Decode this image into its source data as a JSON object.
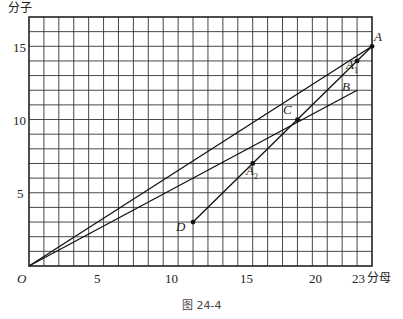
{
  "axes": {
    "y_label": "分子",
    "x_label": "分母",
    "origin": "O",
    "x_ticks": [
      "5",
      "10",
      "15",
      "20",
      "23"
    ],
    "y_ticks": [
      "5",
      "10",
      "15"
    ]
  },
  "points": {
    "A": "A",
    "A1": "A",
    "A1_sub": "1",
    "A2": "A",
    "A2_sub": "2",
    "B": "B",
    "C": "C",
    "D": "D"
  },
  "caption": "图 24-4",
  "chart_data": {
    "type": "line",
    "title": "图 24-4",
    "xlabel": "分母",
    "ylabel": "分子",
    "xlim": [
      0,
      23
    ],
    "ylim": [
      0,
      17
    ],
    "grid": true,
    "points": [
      {
        "name": "O",
        "x": 0,
        "y": 0
      },
      {
        "name": "A",
        "x": 23,
        "y": 15
      },
      {
        "name": "A1",
        "x": 22,
        "y": 14
      },
      {
        "name": "B",
        "x": 22,
        "y": 12
      },
      {
        "name": "C",
        "x": 18,
        "y": 10
      },
      {
        "name": "A2",
        "x": 15,
        "y": 7
      },
      {
        "name": "D",
        "x": 11,
        "y": 3
      }
    ],
    "series": [
      {
        "name": "OA",
        "x": [
          0,
          23
        ],
        "y": [
          0,
          15
        ]
      },
      {
        "name": "OB",
        "x": [
          0,
          22
        ],
        "y": [
          0,
          12
        ]
      },
      {
        "name": "DA",
        "x": [
          11,
          23
        ],
        "y": [
          3,
          15
        ]
      }
    ]
  }
}
